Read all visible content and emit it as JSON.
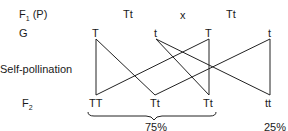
{
  "rows": {
    "f1_label": "F",
    "f1_sub": "1",
    "f1_suffix": " (P)",
    "g_label": "G",
    "self_label": "Self-pollination",
    "f2_label": "F",
    "f2_sub": "2"
  },
  "parents": {
    "p1": "Tt",
    "cross": "x",
    "p2": "Tt"
  },
  "gametes": [
    "T",
    "t",
    "T",
    "t"
  ],
  "f2": [
    "TT",
    "Tt",
    "Tt",
    "tt"
  ],
  "percentages": {
    "dominant": "75%",
    "recessive": "25%"
  }
}
